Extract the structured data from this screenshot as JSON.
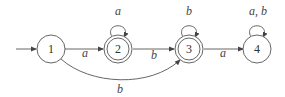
{
  "diagram": {
    "type": "finite-automaton",
    "start_state": "1",
    "states": [
      {
        "id": "1",
        "label": "1",
        "accepting": false,
        "cx": 51,
        "cy": 49
      },
      {
        "id": "2",
        "label": "2",
        "accepting": true,
        "cx": 118,
        "cy": 49
      },
      {
        "id": "3",
        "label": "3",
        "accepting": true,
        "cx": 189,
        "cy": 49
      },
      {
        "id": "4",
        "label": "4",
        "accepting": false,
        "cx": 257,
        "cy": 49
      }
    ],
    "transitions": [
      {
        "from": "1",
        "to": "2",
        "label": "a"
      },
      {
        "from": "2",
        "to": "2",
        "label": "a"
      },
      {
        "from": "2",
        "to": "3",
        "label": "b"
      },
      {
        "from": "1",
        "to": "3",
        "label": "b"
      },
      {
        "from": "3",
        "to": "3",
        "label": "b"
      },
      {
        "from": "3",
        "to": "4",
        "label": "a"
      },
      {
        "from": "4",
        "to": "4",
        "label": "a, b"
      }
    ]
  }
}
